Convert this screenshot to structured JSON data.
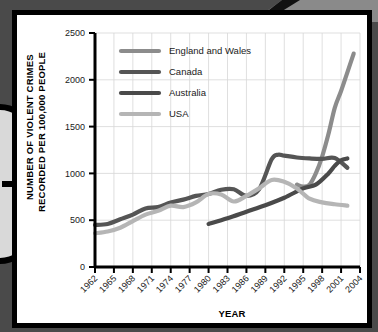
{
  "figure": {
    "decorations": {
      "left_arrow_icon": "right-arrow-icon",
      "corner_wedge": "corner-wedge-decoration"
    }
  },
  "chart_data": {
    "type": "line",
    "title": "",
    "xlabel": "YEAR",
    "ylabel_line1": "NUMBER OF VIOLENT CRIMES",
    "ylabel_line2": "RECORDED PER 100,000 PEOPLE",
    "xlim": [
      1962,
      2004
    ],
    "ylim": [
      0,
      2500
    ],
    "yticks": [
      0,
      500,
      1000,
      1500,
      2000,
      2500
    ],
    "xticks": [
      1962,
      1965,
      1968,
      1971,
      1974,
      1977,
      1980,
      1983,
      1986,
      1989,
      1992,
      1995,
      1998,
      2001,
      2004
    ],
    "grid": true,
    "legend_position": "top-left",
    "series": [
      {
        "name": "England and Wales",
        "color": "#8c8c8c",
        "width": 4.2,
        "x": [
          1962,
          1965,
          1968,
          1971,
          1974,
          1977,
          1980,
          1983,
          1986,
          1989,
          1992,
          1994,
          1995,
          1996,
          1997,
          1998,
          1999,
          2000,
          2001,
          2002,
          2003
        ],
        "y": [
          null,
          null,
          null,
          null,
          null,
          null,
          null,
          null,
          null,
          null,
          null,
          880,
          860,
          880,
          1000,
          1180,
          1420,
          1700,
          1880,
          2080,
          2280
        ]
      },
      {
        "name": "Canada",
        "color": "#555555",
        "width": 4.2,
        "x": [
          1962,
          1964,
          1966,
          1968,
          1970,
          1972,
          1974,
          1976,
          1978,
          1980,
          1982,
          1984,
          1986,
          1988,
          1990,
          1991,
          1992,
          1994,
          1996,
          1998,
          2000,
          2002
        ],
        "y": [
          450,
          460,
          510,
          560,
          625,
          640,
          690,
          720,
          760,
          780,
          825,
          830,
          760,
          830,
          1150,
          1200,
          1190,
          1170,
          1160,
          1155,
          1165,
          1060
        ]
      },
      {
        "name": "Australia",
        "color": "#4a4a4a",
        "width": 4.2,
        "x": [
          1980,
          1983,
          1986,
          1989,
          1992,
          1995,
          1997,
          1999,
          2000,
          2001,
          2002
        ],
        "y": [
          460,
          520,
          590,
          660,
          740,
          840,
          880,
          1000,
          1080,
          1140,
          1160
        ]
      },
      {
        "name": "USA",
        "color": "#b5b5b5",
        "width": 4.2,
        "x": [
          1962,
          1964,
          1966,
          1968,
          1970,
          1972,
          1974,
          1976,
          1978,
          1980,
          1982,
          1984,
          1986,
          1988,
          1990,
          1992,
          1994,
          1996,
          1998,
          2000,
          2002
        ],
        "y": [
          360,
          380,
          420,
          490,
          560,
          600,
          655,
          640,
          690,
          780,
          775,
          700,
          760,
          840,
          930,
          910,
          840,
          730,
          690,
          670,
          655
        ]
      }
    ]
  }
}
